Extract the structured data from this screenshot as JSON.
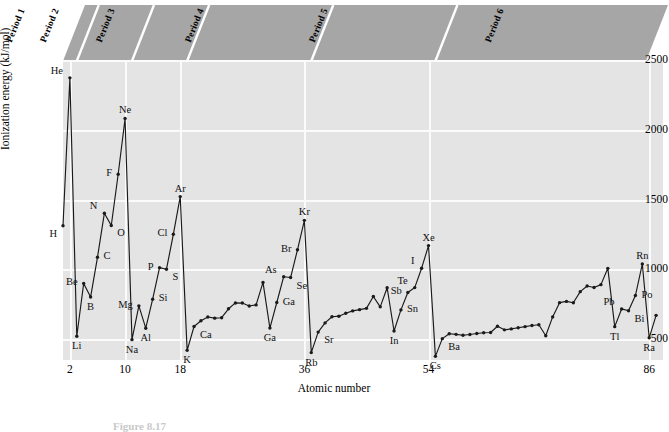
{
  "figure": {
    "caption": "Figure 8.17"
  },
  "axes": {
    "x_title": "Atomic number",
    "y_title": "Ionization energy (kJ/mol)",
    "x_ticks": [
      "2",
      "10",
      "18",
      "36",
      "54",
      "86"
    ],
    "y_ticks": [
      "500",
      "1000",
      "1500",
      "2000",
      "2500"
    ]
  },
  "banner": {
    "periods": [
      "Period 1",
      "Period 2",
      "Period 3",
      "Period 4",
      "Period 5",
      "Period 6"
    ],
    "fill_color": "#a6a6a6",
    "divider_color": "#ffffff"
  },
  "style": {
    "plot_background": "#e4e4e4",
    "gridline_color": "#fbfbfb",
    "line_color": "#1a1a1a",
    "marker_color": "#1a1a1a"
  },
  "chart_data": {
    "type": "line",
    "title": "",
    "xlabel": "Atomic number",
    "ylabel": "Ionization energy (kJ/mol)",
    "xlim": [
      1,
      88
    ],
    "ylim": [
      350,
      2500
    ],
    "grid": true,
    "legend": "none",
    "series": [
      {
        "name": "First ionization energy",
        "points": [
          {
            "z": 1,
            "symbol": "H",
            "value": 1312,
            "label": "H",
            "label_pos": "below-left"
          },
          {
            "z": 2,
            "symbol": "He",
            "value": 2372,
            "label": "He",
            "label_pos": "above-left"
          },
          {
            "z": 3,
            "symbol": "Li",
            "value": 520,
            "label": "Li",
            "label_pos": "below"
          },
          {
            "z": 4,
            "symbol": "Be",
            "value": 899,
            "label": "Be",
            "label_pos": "left"
          },
          {
            "z": 5,
            "symbol": "B",
            "value": 801,
            "label": "B",
            "label_pos": "below"
          },
          {
            "z": 6,
            "symbol": "C",
            "value": 1086,
            "label": "C",
            "label_pos": "right"
          },
          {
            "z": 7,
            "symbol": "N",
            "value": 1402,
            "label": "N",
            "label_pos": "above-left"
          },
          {
            "z": 8,
            "symbol": "O",
            "value": 1314,
            "label": "O",
            "label_pos": "below-right"
          },
          {
            "z": 9,
            "symbol": "F",
            "value": 1681,
            "label": "F",
            "label_pos": "left"
          },
          {
            "z": 10,
            "symbol": "Ne",
            "value": 2081,
            "label": "Ne",
            "label_pos": "above"
          },
          {
            "z": 11,
            "symbol": "Na",
            "value": 496,
            "label": "Na",
            "label_pos": "below"
          },
          {
            "z": 12,
            "symbol": "Mg",
            "value": 738,
            "label": "Mg",
            "label_pos": "left"
          },
          {
            "z": 13,
            "symbol": "Al",
            "value": 578,
            "label": "Al",
            "label_pos": "below"
          },
          {
            "z": 14,
            "symbol": "Si",
            "value": 786,
            "label": "Si",
            "label_pos": "right"
          },
          {
            "z": 15,
            "symbol": "P",
            "value": 1012,
            "label": "P",
            "label_pos": "left"
          },
          {
            "z": 16,
            "symbol": "S",
            "value": 1000,
            "label": "S",
            "label_pos": "below-right"
          },
          {
            "z": 17,
            "symbol": "Cl",
            "value": 1251,
            "label": "Cl",
            "label_pos": "left"
          },
          {
            "z": 18,
            "symbol": "Ar",
            "value": 1521,
            "label": "Ar",
            "label_pos": "above"
          },
          {
            "z": 19,
            "symbol": "K",
            "value": 419,
            "label": "K",
            "label_pos": "below"
          },
          {
            "z": 20,
            "symbol": "Ca",
            "value": 590,
            "label": "Ca",
            "label_pos": "below-right"
          },
          {
            "z": 21,
            "symbol": "Sc",
            "value": 631,
            "label": ""
          },
          {
            "z": 22,
            "symbol": "Ti",
            "value": 658,
            "label": ""
          },
          {
            "z": 23,
            "symbol": "V",
            "value": 650,
            "label": ""
          },
          {
            "z": 24,
            "symbol": "Cr",
            "value": 653,
            "label": ""
          },
          {
            "z": 25,
            "symbol": "Mn",
            "value": 717,
            "label": ""
          },
          {
            "z": 26,
            "symbol": "Fe",
            "value": 759,
            "label": ""
          },
          {
            "z": 27,
            "symbol": "Co",
            "value": 758,
            "label": ""
          },
          {
            "z": 28,
            "symbol": "Ni",
            "value": 737,
            "label": ""
          },
          {
            "z": 29,
            "symbol": "Cu",
            "value": 745,
            "label": ""
          },
          {
            "z": 30,
            "symbol": "Zn",
            "value": 906,
            "label": ""
          },
          {
            "z": 31,
            "symbol": "Ga",
            "value": 579,
            "label": "Ga",
            "label_pos": "below"
          },
          {
            "z": 32,
            "symbol": "Ge",
            "value": 762,
            "label": "Ga",
            "label_pos": "right"
          },
          {
            "z": 33,
            "symbol": "As",
            "value": 947,
            "label": "As",
            "label_pos": "above-left"
          },
          {
            "z": 34,
            "symbol": "Se",
            "value": 941,
            "label": "Se",
            "label_pos": "below-right"
          },
          {
            "z": 35,
            "symbol": "Br",
            "value": 1140,
            "label": "Br",
            "label_pos": "left"
          },
          {
            "z": 36,
            "symbol": "Kr",
            "value": 1351,
            "label": "Kr",
            "label_pos": "above"
          },
          {
            "z": 37,
            "symbol": "Rb",
            "value": 403,
            "label": "Rb",
            "label_pos": "below"
          },
          {
            "z": 38,
            "symbol": "Sr",
            "value": 550,
            "label": "Sr",
            "label_pos": "below-right"
          },
          {
            "z": 39,
            "symbol": "Y",
            "value": 616,
            "label": ""
          },
          {
            "z": 40,
            "symbol": "Zr",
            "value": 660,
            "label": ""
          },
          {
            "z": 41,
            "symbol": "Nb",
            "value": 664,
            "label": ""
          },
          {
            "z": 42,
            "symbol": "Mo",
            "value": 685,
            "label": ""
          },
          {
            "z": 43,
            "symbol": "Tc",
            "value": 702,
            "label": ""
          },
          {
            "z": 44,
            "symbol": "Ru",
            "value": 711,
            "label": ""
          },
          {
            "z": 45,
            "symbol": "Rh",
            "value": 720,
            "label": ""
          },
          {
            "z": 46,
            "symbol": "Pd",
            "value": 805,
            "label": ""
          },
          {
            "z": 47,
            "symbol": "Ag",
            "value": 731,
            "label": ""
          },
          {
            "z": 48,
            "symbol": "Cd",
            "value": 868,
            "label": ""
          },
          {
            "z": 49,
            "symbol": "In",
            "value": 558,
            "label": "In",
            "label_pos": "below"
          },
          {
            "z": 50,
            "symbol": "Sn",
            "value": 709,
            "label": "Sn",
            "label_pos": "right"
          },
          {
            "z": 51,
            "symbol": "Sb",
            "value": 834,
            "label": "Sb",
            "label_pos": "left"
          },
          {
            "z": 52,
            "symbol": "Te",
            "value": 869,
            "label": "Te",
            "label_pos": "above-left"
          },
          {
            "z": 53,
            "symbol": "I",
            "value": 1008,
            "label": "I",
            "label_pos": "above-left"
          },
          {
            "z": 54,
            "symbol": "Xe",
            "value": 1170,
            "label": "Xe",
            "label_pos": "above"
          },
          {
            "z": 55,
            "symbol": "Cs",
            "value": 376,
            "label": "Cs",
            "label_pos": "below"
          },
          {
            "z": 56,
            "symbol": "Ba",
            "value": 503,
            "label": "Ba",
            "label_pos": "below-right"
          },
          {
            "z": 57,
            "symbol": "La",
            "value": 538,
            "label": ""
          },
          {
            "z": 58,
            "symbol": "Ce",
            "value": 534,
            "label": ""
          },
          {
            "z": 59,
            "symbol": "Pr",
            "value": 527,
            "label": ""
          },
          {
            "z": 60,
            "symbol": "Nd",
            "value": 533,
            "label": ""
          },
          {
            "z": 61,
            "symbol": "Pm",
            "value": 540,
            "label": ""
          },
          {
            "z": 62,
            "symbol": "Sm",
            "value": 545,
            "label": ""
          },
          {
            "z": 63,
            "symbol": "Eu",
            "value": 547,
            "label": ""
          },
          {
            "z": 64,
            "symbol": "Gd",
            "value": 592,
            "label": ""
          },
          {
            "z": 65,
            "symbol": "Tb",
            "value": 566,
            "label": ""
          },
          {
            "z": 66,
            "symbol": "Dy",
            "value": 573,
            "label": ""
          },
          {
            "z": 67,
            "symbol": "Ho",
            "value": 581,
            "label": ""
          },
          {
            "z": 68,
            "symbol": "Er",
            "value": 589,
            "label": ""
          },
          {
            "z": 69,
            "symbol": "Tm",
            "value": 597,
            "label": ""
          },
          {
            "z": 70,
            "symbol": "Yb",
            "value": 603,
            "label": ""
          },
          {
            "z": 71,
            "symbol": "Lu",
            "value": 524,
            "label": ""
          },
          {
            "z": 72,
            "symbol": "Hf",
            "value": 659,
            "label": ""
          },
          {
            "z": 73,
            "symbol": "Ta",
            "value": 761,
            "label": ""
          },
          {
            "z": 74,
            "symbol": "W",
            "value": 770,
            "label": ""
          },
          {
            "z": 75,
            "symbol": "Re",
            "value": 760,
            "label": ""
          },
          {
            "z": 76,
            "symbol": "Os",
            "value": 840,
            "label": ""
          },
          {
            "z": 77,
            "symbol": "Ir",
            "value": 880,
            "label": ""
          },
          {
            "z": 78,
            "symbol": "Pt",
            "value": 870,
            "label": ""
          },
          {
            "z": 79,
            "symbol": "Au",
            "value": 890,
            "label": ""
          },
          {
            "z": 80,
            "symbol": "Hg",
            "value": 1007,
            "label": ""
          },
          {
            "z": 81,
            "symbol": "Tl",
            "value": 589,
            "label": "Tl",
            "label_pos": "below"
          },
          {
            "z": 82,
            "symbol": "Pb",
            "value": 716,
            "label": "Pb",
            "label_pos": "above-left"
          },
          {
            "z": 83,
            "symbol": "Bi",
            "value": 703,
            "label": "Bi",
            "label_pos": "below-right"
          },
          {
            "z": 84,
            "symbol": "Po",
            "value": 812,
            "label": "Po",
            "label_pos": "right"
          },
          {
            "z": 85,
            "symbol": "Rn",
            "value": 1038,
            "label": "Rn",
            "label_pos": "above"
          },
          {
            "z": 86,
            "symbol": "Ra",
            "value": 509,
            "label": "Ra",
            "label_pos": "below"
          },
          {
            "z": 87,
            "symbol": "Ac",
            "value": 670,
            "label": ""
          }
        ]
      }
    ]
  }
}
